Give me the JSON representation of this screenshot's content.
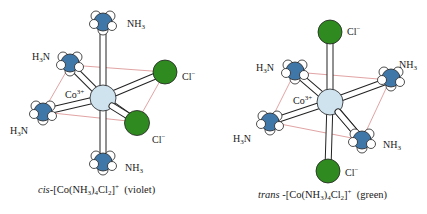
{
  "figure": {
    "colors": {
      "cobalt": "#cfe3ee",
      "nitrogen": "#3f77a8",
      "hydrogen": "#ffffff",
      "chlorine": "#2f8a1f",
      "plane_edge": "#d98c8c",
      "bond": "#ffffff"
    },
    "cis": {
      "center_label": {
        "sym": "Co",
        "charge": "3+"
      },
      "ligands": [
        {
          "position": "top",
          "formula": "NH",
          "sub": "3",
          "order": "NH3"
        },
        {
          "position": "upper-left",
          "formula": "H",
          "sub": "3",
          "tail": "N",
          "order": "H3N"
        },
        {
          "position": "left",
          "formula": "H",
          "sub": "3",
          "tail": "N",
          "order": "H3N"
        },
        {
          "position": "bottom",
          "formula": "NH",
          "sub": "3",
          "order": "NH3"
        },
        {
          "position": "upper-right",
          "formula": "Cl",
          "charge": "−"
        },
        {
          "position": "lower-right",
          "formula": "Cl",
          "charge": "−"
        }
      ],
      "caption": {
        "prefix": "cis",
        "dash": "-[Co(NH",
        "sub1": "3",
        "mid": ")",
        "sub2": "4",
        "mid2": "Cl",
        "sub3": "2",
        "close": "]",
        "charge": "+",
        "color_note": "(violet)"
      }
    },
    "trans": {
      "center_label": {
        "sym": "Co",
        "charge": "3+"
      },
      "ligands": [
        {
          "position": "top",
          "formula": "Cl",
          "charge": "−"
        },
        {
          "position": "upper-left",
          "formula": "H",
          "sub": "3",
          "tail": "N",
          "order": "H3N"
        },
        {
          "position": "left",
          "formula": "H",
          "sub": "3",
          "tail": "N",
          "order": "H3N"
        },
        {
          "position": "upper-right",
          "formula": "NH",
          "sub": "3",
          "order": "NH3"
        },
        {
          "position": "lower-right",
          "formula": "NH",
          "sub": "3",
          "order": "NH3"
        },
        {
          "position": "bottom",
          "formula": "Cl",
          "charge": "−"
        }
      ],
      "caption": {
        "prefix": "trans",
        "dash": " -[Co(NH",
        "sub1": "3",
        "mid": ")",
        "sub2": "4",
        "mid2": "Cl",
        "sub3": "2",
        "close": "]",
        "charge": "+",
        "color_note": "(green)"
      }
    }
  }
}
